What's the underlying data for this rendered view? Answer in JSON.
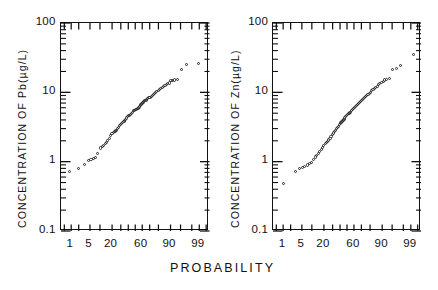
{
  "figure": {
    "xlabel": "PROBABILITY",
    "panels": [
      {
        "id": "pb",
        "ylabel": "CONCENTRATION OF Pb(µg/L)",
        "ytick_labels": [
          "100",
          "10",
          "1",
          "0.1"
        ],
        "xtick_labels": [
          "1",
          "5",
          "20",
          "60",
          "90",
          "99"
        ]
      },
      {
        "id": "zn",
        "ylabel": "CONCENTRATION OF Zn(µg/L)",
        "ytick_labels": [
          "100",
          "10",
          "1",
          "0.1"
        ],
        "xtick_labels": [
          "1",
          "5",
          "20",
          "60",
          "90",
          "99"
        ]
      }
    ]
  },
  "chart_data": [
    {
      "type": "scatter",
      "title": "",
      "subtitle": "",
      "xlabel": "PROBABILITY",
      "ylabel": "CONCENTRATION OF Pb(µg/L)",
      "x_scale": "normal-probability",
      "y_scale": "log10",
      "xlim": [
        0.2,
        99.9
      ],
      "ylim": [
        0.1,
        100
      ],
      "x_ticks_major": [
        1,
        5,
        20,
        60,
        90,
        99
      ],
      "x_ticks_all": [
        0.5,
        1,
        2,
        5,
        10,
        20,
        30,
        40,
        50,
        60,
        70,
        80,
        90,
        95,
        98,
        99,
        99.5
      ],
      "y_ticks_major": [
        0.1,
        1,
        10,
        100
      ],
      "grid": false,
      "legend": null,
      "marker": "open-circle",
      "series": [
        {
          "name": "Pb concentration cumulative probability",
          "points": [
            [
              0.9,
              0.7
            ],
            [
              2.0,
              0.78
            ],
            [
              3.4,
              0.9
            ],
            [
              4.6,
              1.02
            ],
            [
              5.6,
              1.05
            ],
            [
              6.6,
              1.08
            ],
            [
              7.6,
              1.12
            ],
            [
              9.0,
              1.3
            ],
            [
              10.8,
              1.55
            ],
            [
              12.0,
              1.62
            ],
            [
              13.0,
              1.7
            ],
            [
              14.2,
              1.8
            ],
            [
              15.2,
              1.88
            ],
            [
              16.4,
              2.0
            ],
            [
              17.6,
              2.1
            ],
            [
              19.0,
              2.35
            ],
            [
              20.4,
              2.5
            ],
            [
              21.6,
              2.6
            ],
            [
              22.8,
              2.65
            ],
            [
              24.0,
              2.72
            ],
            [
              25.4,
              2.8
            ],
            [
              26.8,
              2.95
            ],
            [
              28.0,
              3.1
            ],
            [
              29.4,
              3.25
            ],
            [
              30.8,
              3.4
            ],
            [
              32.0,
              3.5
            ],
            [
              33.4,
              3.62
            ],
            [
              34.8,
              3.72
            ],
            [
              36.0,
              3.82
            ],
            [
              37.4,
              4.0
            ],
            [
              38.8,
              4.2
            ],
            [
              40.0,
              4.35
            ],
            [
              41.4,
              4.5
            ],
            [
              42.8,
              4.62
            ],
            [
              44.2,
              4.75
            ],
            [
              45.6,
              4.9
            ],
            [
              47.0,
              5.1
            ],
            [
              48.4,
              5.3
            ],
            [
              49.8,
              5.45
            ],
            [
              51.0,
              5.55
            ],
            [
              52.4,
              5.6
            ],
            [
              53.8,
              5.7
            ],
            [
              55.0,
              5.85
            ],
            [
              56.4,
              6.05
            ],
            [
              57.8,
              6.3
            ],
            [
              59.0,
              6.55
            ],
            [
              60.4,
              6.8
            ],
            [
              61.8,
              7.0
            ],
            [
              63.0,
              7.2
            ],
            [
              64.4,
              7.4
            ],
            [
              65.8,
              7.6
            ],
            [
              67.0,
              7.8
            ],
            [
              68.4,
              8.0
            ],
            [
              69.8,
              8.2
            ],
            [
              71.0,
              8.4
            ],
            [
              72.4,
              8.6
            ],
            [
              73.8,
              8.85
            ],
            [
              75.0,
              9.1
            ],
            [
              76.4,
              9.4
            ],
            [
              77.8,
              9.7
            ],
            [
              79.0,
              10.0
            ],
            [
              80.4,
              10.4
            ],
            [
              81.6,
              10.8
            ],
            [
              82.8,
              11.2
            ],
            [
              84.0,
              11.6
            ],
            [
              85.2,
              12.0
            ],
            [
              86.4,
              12.4
            ],
            [
              87.4,
              12.8
            ],
            [
              88.4,
              13.1
            ],
            [
              89.4,
              13.4
            ],
            [
              90.6,
              14.4
            ],
            [
              91.6,
              14.6
            ],
            [
              92.6,
              14.8
            ],
            [
              94.0,
              15.0
            ],
            [
              95.6,
              21.0
            ],
            [
              97.0,
              25.0
            ],
            [
              99.0,
              26.0
            ]
          ]
        }
      ]
    },
    {
      "type": "scatter",
      "title": "",
      "subtitle": "",
      "xlabel": "PROBABILITY",
      "ylabel": "CONCENTRATION OF Zn(µg/L)",
      "x_scale": "normal-probability",
      "y_scale": "log10",
      "xlim": [
        0.2,
        99.9
      ],
      "ylim": [
        0.1,
        100
      ],
      "x_ticks_major": [
        1,
        5,
        20,
        60,
        90,
        99
      ],
      "x_ticks_all": [
        0.5,
        1,
        2,
        5,
        10,
        20,
        30,
        40,
        50,
        60,
        70,
        80,
        90,
        95,
        98,
        99,
        99.5
      ],
      "y_ticks_major": [
        0.1,
        1,
        10,
        100
      ],
      "grid": false,
      "legend": null,
      "marker": "open-circle",
      "series": [
        {
          "name": "Zn concentration cumulative probability",
          "points": [
            [
              1.0,
              0.48
            ],
            [
              3.0,
              0.72
            ],
            [
              4.2,
              0.78
            ],
            [
              5.2,
              0.8
            ],
            [
              6.2,
              0.84
            ],
            [
              7.4,
              0.88
            ],
            [
              8.6,
              0.92
            ],
            [
              9.8,
              0.96
            ],
            [
              11.0,
              1.05
            ],
            [
              12.4,
              1.15
            ],
            [
              13.6,
              1.22
            ],
            [
              14.8,
              1.3
            ],
            [
              16.0,
              1.38
            ],
            [
              17.4,
              1.48
            ],
            [
              18.8,
              1.58
            ],
            [
              20.0,
              1.7
            ],
            [
              21.4,
              1.8
            ],
            [
              22.8,
              1.88
            ],
            [
              24.0,
              1.95
            ],
            [
              25.4,
              2.02
            ],
            [
              26.8,
              2.12
            ],
            [
              28.0,
              2.25
            ],
            [
              29.4,
              2.4
            ],
            [
              30.8,
              2.55
            ],
            [
              32.0,
              2.7
            ],
            [
              33.4,
              2.8
            ],
            [
              34.8,
              2.92
            ],
            [
              36.0,
              3.05
            ],
            [
              37.4,
              3.2
            ],
            [
              38.8,
              3.35
            ],
            [
              40.0,
              3.5
            ],
            [
              41.4,
              3.62
            ],
            [
              42.8,
              3.75
            ],
            [
              44.2,
              3.9
            ],
            [
              45.6,
              4.05
            ],
            [
              47.0,
              4.2
            ],
            [
              48.4,
              4.35
            ],
            [
              49.8,
              4.5
            ],
            [
              51.0,
              4.65
            ],
            [
              52.4,
              4.8
            ],
            [
              53.8,
              4.95
            ],
            [
              55.0,
              5.1
            ],
            [
              56.4,
              5.3
            ],
            [
              57.8,
              5.5
            ],
            [
              59.0,
              5.7
            ],
            [
              60.4,
              5.9
            ],
            [
              61.8,
              6.1
            ],
            [
              63.0,
              6.3
            ],
            [
              64.4,
              6.5
            ],
            [
              65.8,
              6.75
            ],
            [
              67.0,
              7.0
            ],
            [
              68.4,
              7.25
            ],
            [
              69.8,
              7.5
            ],
            [
              71.0,
              7.75
            ],
            [
              72.4,
              8.0
            ],
            [
              73.8,
              8.3
            ],
            [
              75.0,
              8.6
            ],
            [
              76.4,
              8.9
            ],
            [
              77.8,
              9.2
            ],
            [
              79.0,
              9.5
            ],
            [
              80.4,
              9.9
            ],
            [
              81.6,
              10.3
            ],
            [
              82.8,
              10.7
            ],
            [
              84.0,
              11.1
            ],
            [
              85.2,
              11.6
            ],
            [
              86.4,
              12.1
            ],
            [
              87.4,
              12.6
            ],
            [
              88.4,
              13.1
            ],
            [
              89.4,
              13.6
            ],
            [
              90.6,
              14.2
            ],
            [
              91.6,
              14.8
            ],
            [
              92.6,
              15.2
            ],
            [
              94.0,
              15.5
            ],
            [
              95.2,
              21.0
            ],
            [
              96.4,
              22.0
            ],
            [
              97.4,
              24.0
            ],
            [
              99.2,
              35.0
            ]
          ]
        }
      ]
    }
  ]
}
